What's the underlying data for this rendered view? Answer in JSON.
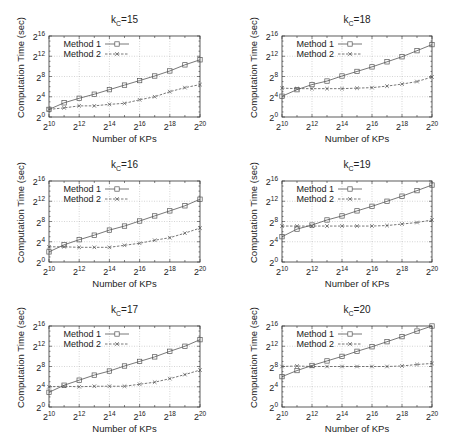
{
  "chart_data": [
    {
      "type": "line",
      "title": "k_C=15",
      "title_base": "k",
      "title_sub": "C",
      "title_rest": "=15",
      "xlabel": "Number of KPs",
      "ylabel": "Computation Time (sec)",
      "x_log2": [
        10,
        11,
        12,
        13,
        14,
        15,
        16,
        17,
        18,
        19,
        20
      ],
      "xticks": [
        "2^10",
        "2^12",
        "2^14",
        "2^16",
        "2^18",
        "2^20"
      ],
      "yticks": [
        "2^0",
        "2^4",
        "2^8",
        "2^12",
        "2^16"
      ],
      "ylim_log2": [
        0,
        16
      ],
      "xlim_log2": [
        10,
        20
      ],
      "grid": true,
      "legend_position": "upper-left",
      "series": [
        {
          "name": "Method 1",
          "marker": "square",
          "line": "solid",
          "values_log2": [
            1.5,
            2.8,
            3.7,
            4.5,
            5.4,
            6.3,
            7.2,
            8.1,
            9.1,
            10.3,
            11.3
          ]
        },
        {
          "name": "Method 2",
          "marker": "x",
          "line": "dashed",
          "values_log2": [
            1.5,
            1.8,
            2.2,
            2.2,
            2.5,
            2.7,
            3.4,
            4.0,
            5.0,
            5.8,
            6.4
          ]
        }
      ]
    },
    {
      "type": "line",
      "title": "k_C=18",
      "title_base": "k",
      "title_sub": "C",
      "title_rest": "=18",
      "xlabel": "Number of KPs",
      "ylabel": "Computation Time (sec)",
      "x_log2": [
        10,
        11,
        12,
        13,
        14,
        15,
        16,
        17,
        18,
        19,
        20
      ],
      "xticks": [
        "2^10",
        "2^12",
        "2^14",
        "2^16",
        "2^18",
        "2^20"
      ],
      "yticks": [
        "2^0",
        "2^4",
        "2^8",
        "2^12",
        "2^16"
      ],
      "ylim_log2": [
        0,
        16
      ],
      "xlim_log2": [
        10,
        20
      ],
      "grid": true,
      "legend_position": "upper-left",
      "series": [
        {
          "name": "Method 1",
          "marker": "square",
          "line": "solid",
          "values_log2": [
            4.1,
            5.4,
            6.4,
            7.1,
            8.1,
            9.0,
            9.9,
            10.9,
            11.9,
            13.1,
            14.3
          ]
        },
        {
          "name": "Method 2",
          "marker": "x",
          "line": "dashed",
          "values_log2": [
            5.7,
            5.6,
            5.6,
            5.6,
            5.6,
            5.7,
            5.8,
            6.1,
            6.5,
            7.0,
            7.9
          ]
        }
      ]
    },
    {
      "type": "line",
      "title": "k_C=16",
      "title_base": "k",
      "title_sub": "C",
      "title_rest": "=16",
      "xlabel": "Number of KPs",
      "ylabel": "Computation Time (sec)",
      "x_log2": [
        10,
        11,
        12,
        13,
        14,
        15,
        16,
        17,
        18,
        19,
        20
      ],
      "xticks": [
        "2^10",
        "2^12",
        "2^14",
        "2^16",
        "2^18",
        "2^20"
      ],
      "yticks": [
        "2^0",
        "2^4",
        "2^8",
        "2^12",
        "2^16"
      ],
      "ylim_log2": [
        0,
        16
      ],
      "xlim_log2": [
        10,
        20
      ],
      "grid": true,
      "legend_position": "upper-left",
      "series": [
        {
          "name": "Method 1",
          "marker": "square",
          "line": "solid",
          "values_log2": [
            2.0,
            3.4,
            4.4,
            5.3,
            6.3,
            7.1,
            8.1,
            9.1,
            10.1,
            11.1,
            12.4
          ]
        },
        {
          "name": "Method 2",
          "marker": "x",
          "line": "dashed",
          "values_log2": [
            3.0,
            3.0,
            2.9,
            2.9,
            2.9,
            3.3,
            3.7,
            4.3,
            4.8,
            5.7,
            6.7
          ]
        }
      ]
    },
    {
      "type": "line",
      "title": "k_C=19",
      "title_base": "k",
      "title_sub": "C",
      "title_rest": "=19",
      "xlabel": "Number of KPs",
      "ylabel": "Computation Time (sec)",
      "x_log2": [
        10,
        11,
        12,
        13,
        14,
        15,
        16,
        17,
        18,
        19,
        20
      ],
      "xticks": [
        "2^10",
        "2^12",
        "2^14",
        "2^16",
        "2^18",
        "2^20"
      ],
      "yticks": [
        "2^0",
        "2^4",
        "2^8",
        "2^12",
        "2^16"
      ],
      "ylim_log2": [
        0,
        16
      ],
      "xlim_log2": [
        10,
        20
      ],
      "grid": true,
      "legend_position": "upper-left",
      "series": [
        {
          "name": "Method 1",
          "marker": "square",
          "line": "solid",
          "values_log2": [
            5.0,
            6.5,
            7.3,
            8.3,
            9.1,
            10.1,
            11.0,
            12.0,
            13.0,
            14.1,
            15.2
          ]
        },
        {
          "name": "Method 2",
          "marker": "x",
          "line": "dashed",
          "values_log2": [
            7.1,
            7.1,
            7.1,
            7.1,
            7.1,
            7.1,
            7.1,
            7.2,
            7.5,
            7.8,
            8.3
          ]
        }
      ]
    },
    {
      "type": "line",
      "title": "k_C=17",
      "title_base": "k",
      "title_sub": "C",
      "title_rest": "=17",
      "xlabel": "Number of KPs",
      "ylabel": "Computation Time (sec)",
      "x_log2": [
        10,
        11,
        12,
        13,
        14,
        15,
        16,
        17,
        18,
        19,
        20
      ],
      "xticks": [
        "2^10",
        "2^12",
        "2^14",
        "2^16",
        "2^18",
        "2^20"
      ],
      "yticks": [
        "2^0",
        "2^4",
        "2^8",
        "2^12",
        "2^16"
      ],
      "ylim_log2": [
        0,
        16
      ],
      "xlim_log2": [
        10,
        20
      ],
      "grid": true,
      "legend_position": "upper-left",
      "series": [
        {
          "name": "Method 1",
          "marker": "square",
          "line": "solid",
          "values_log2": [
            2.9,
            4.3,
            5.3,
            6.3,
            7.1,
            8.1,
            9.0,
            9.9,
            11.0,
            12.0,
            13.3
          ]
        },
        {
          "name": "Method 2",
          "marker": "x",
          "line": "dashed",
          "values_log2": [
            4.0,
            4.1,
            4.0,
            4.1,
            4.1,
            4.1,
            4.5,
            4.9,
            5.6,
            6.4,
            7.3
          ]
        }
      ]
    },
    {
      "type": "line",
      "title": "k_C=20",
      "title_base": "k",
      "title_sub": "C",
      "title_rest": "=20",
      "xlabel": "Number of KPs",
      "ylabel": "Computation Time (sec)",
      "x_log2": [
        10,
        11,
        12,
        13,
        14,
        15,
        16,
        17,
        18,
        19,
        20
      ],
      "xticks": [
        "2^10",
        "2^12",
        "2^14",
        "2^16",
        "2^18",
        "2^20"
      ],
      "yticks": [
        "2^0",
        "2^4",
        "2^8",
        "2^12",
        "2^16"
      ],
      "ylim_log2": [
        0,
        16
      ],
      "xlim_log2": [
        10,
        20
      ],
      "grid": true,
      "legend_position": "upper-left",
      "series": [
        {
          "name": "Method 1",
          "marker": "square",
          "line": "solid",
          "values_log2": [
            6.0,
            7.2,
            8.2,
            9.1,
            10.0,
            11.0,
            11.9,
            12.9,
            13.9,
            15.0,
            16.0
          ]
        },
        {
          "name": "Method 2",
          "marker": "x",
          "line": "dashed",
          "values_log2": [
            8.0,
            8.1,
            8.0,
            8.0,
            8.0,
            8.0,
            8.0,
            8.0,
            8.1,
            8.4,
            8.6
          ]
        }
      ]
    }
  ],
  "colors": {
    "line": "#555555",
    "grid": "#bbbbbb",
    "axis": "#333333",
    "text": "#222222",
    "background": "#ffffff"
  }
}
